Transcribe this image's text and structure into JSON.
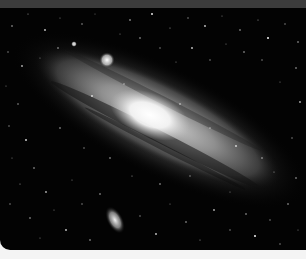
{
  "image": {
    "subject": "Andromeda Galaxy photograph",
    "alt": "Grayscale photograph of a large spiral galaxy seen at an oblique angle against a dense star field, with a bright foreground star and an elongated satellite galaxy below",
    "colors": {
      "top_strip": "#3c3c3c",
      "sky": "#030303",
      "bottom_strip": "#f4f4f4",
      "galaxy_core": "#ffffff",
      "galaxy_disk": "#9a9a9a",
      "dust_lane": "#1a1a1a"
    },
    "features": [
      {
        "name": "galaxy-core",
        "x": 150,
        "y": 115
      },
      {
        "name": "bright-star",
        "x": 107,
        "y": 60
      },
      {
        "name": "satellite-galaxy",
        "x": 115,
        "y": 220
      }
    ]
  }
}
